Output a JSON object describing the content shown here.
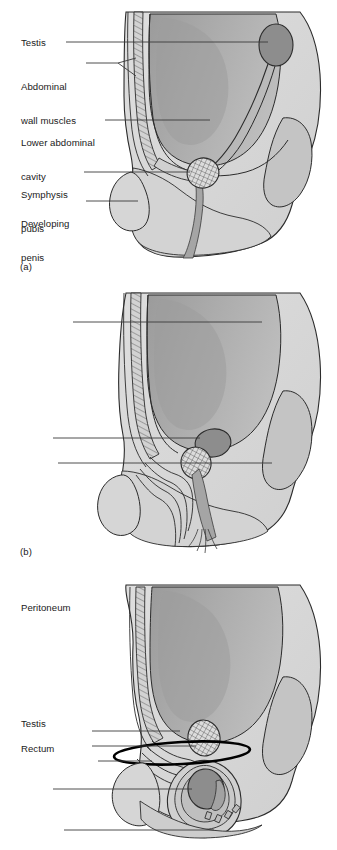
{
  "figure": {
    "panel_count": 3,
    "palette": {
      "background": "#ffffff",
      "body_light": "#d9d9d9",
      "body_mid": "#c6c6c6",
      "cavity_gray": "#a9a9a9",
      "cavity_dark": "#9a9a9a",
      "testis_gray": "#8d8d8d",
      "organ_shadow": "#b3b3b3",
      "outline": "#2b2b2b",
      "leader_line": "#3a3a3a",
      "hatch": "#555555",
      "text": "#1a1a1a"
    }
  },
  "panels": [
    {
      "id": "a",
      "caption": "(a)",
      "labels": [
        {
          "id": "testis",
          "text": "Testis",
          "lines": [
            "Testis"
          ]
        },
        {
          "id": "abdominal-wall",
          "text": "Abdominal wall muscles",
          "lines": [
            "Abdominal",
            "wall muscles"
          ]
        },
        {
          "id": "lower-abdominal",
          "text": "Lower abdominal cavity",
          "lines": [
            "Lower abdominal",
            "cavity"
          ]
        },
        {
          "id": "symphysis-pubis",
          "text": "Symphysis pubis",
          "lines": [
            "Symphysis",
            "pubis"
          ]
        },
        {
          "id": "developing-penis",
          "text": "Developing penis",
          "lines": [
            "Developing",
            "penis"
          ]
        }
      ]
    },
    {
      "id": "b",
      "caption": "(b)",
      "labels": [
        {
          "id": "peritoneum",
          "text": "Peritoneum",
          "lines": [
            "Peritoneum"
          ]
        },
        {
          "id": "testis",
          "text": "Testis",
          "lines": [
            "Testis"
          ]
        },
        {
          "id": "rectum",
          "text": "Rectum",
          "lines": [
            "Rectum"
          ]
        }
      ]
    },
    {
      "id": "c",
      "caption": "(c)",
      "labels": [
        {
          "id": "inguinal-canal",
          "text": "Inguinal canal",
          "lines": [
            "Inguinal canal"
          ]
        },
        {
          "id": "vas-deferens",
          "text": "Vas deferens",
          "lines": [
            "Vas deferens"
          ]
        },
        {
          "id": "spermatic-cord",
          "text": "Spermatic cord",
          "lines": [
            "Spermatic cord"
          ]
        },
        {
          "id": "testis",
          "text": "Testis",
          "lines": [
            "Testis"
          ]
        },
        {
          "id": "scrotum",
          "text": "Scrotum",
          "lines": [
            "Scrotum"
          ]
        }
      ]
    }
  ]
}
